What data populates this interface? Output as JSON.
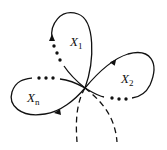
{
  "diagram": {
    "labels": {
      "x1": {
        "base": "X",
        "sub": "1"
      },
      "x2": {
        "base": "X",
        "sub": "2"
      },
      "xn": {
        "base": "X",
        "sub": "n"
      }
    },
    "colors": {
      "stroke": "#111111",
      "background": "#ffffff"
    }
  }
}
